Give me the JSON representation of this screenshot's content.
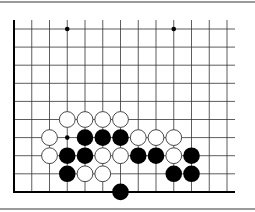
{
  "diagram": {
    "type": "go-board-partial",
    "grid": {
      "columns": 13,
      "rows": 10,
      "origin_x": 14,
      "origin_y": 29,
      "spacing_x": 17.75,
      "spacing_y": 18.1,
      "top_extend": 9,
      "right_extend": 8,
      "edges": [
        "left",
        "bottom"
      ]
    },
    "colors": {
      "line": "#333333",
      "edge": "#000000",
      "black_stone": "#000000",
      "white_stone": "#ffffff",
      "white_outline": "#333333",
      "frame": "#9a9a9a"
    },
    "star_points": [
      {
        "col": 3,
        "row": 0
      },
      {
        "col": 9,
        "row": 0
      }
    ],
    "markers": [
      {
        "col": 3,
        "row": 6,
        "type": "dot"
      }
    ],
    "stones": [
      {
        "col": 3,
        "row": 5,
        "color": "white"
      },
      {
        "col": 4,
        "row": 5,
        "color": "white"
      },
      {
        "col": 5,
        "row": 5,
        "color": "white"
      },
      {
        "col": 6,
        "row": 5,
        "color": "white"
      },
      {
        "col": 2,
        "row": 6,
        "color": "white"
      },
      {
        "col": 4,
        "row": 6,
        "color": "black"
      },
      {
        "col": 5,
        "row": 6,
        "color": "black"
      },
      {
        "col": 6,
        "row": 6,
        "color": "black"
      },
      {
        "col": 7,
        "row": 6,
        "color": "white"
      },
      {
        "col": 8,
        "row": 6,
        "color": "white"
      },
      {
        "col": 9,
        "row": 6,
        "color": "white"
      },
      {
        "col": 2,
        "row": 7,
        "color": "white"
      },
      {
        "col": 3,
        "row": 7,
        "color": "black"
      },
      {
        "col": 4,
        "row": 7,
        "color": "black"
      },
      {
        "col": 5,
        "row": 7,
        "color": "white"
      },
      {
        "col": 6,
        "row": 7,
        "color": "white"
      },
      {
        "col": 7,
        "row": 7,
        "color": "black"
      },
      {
        "col": 8,
        "row": 7,
        "color": "black"
      },
      {
        "col": 9,
        "row": 7,
        "color": "white"
      },
      {
        "col": 10,
        "row": 7,
        "color": "black"
      },
      {
        "col": 3,
        "row": 8,
        "color": "black"
      },
      {
        "col": 4,
        "row": 8,
        "color": "white"
      },
      {
        "col": 5,
        "row": 8,
        "color": "white"
      },
      {
        "col": 9,
        "row": 8,
        "color": "black"
      },
      {
        "col": 10,
        "row": 8,
        "color": "black"
      },
      {
        "col": 6,
        "row": 9,
        "color": "black"
      }
    ]
  }
}
